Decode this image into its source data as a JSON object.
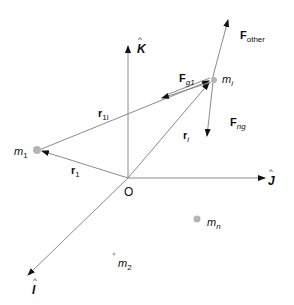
{
  "diagram": {
    "title": "",
    "origin_label": "O",
    "axes": {
      "k": {
        "label": "K"
      },
      "j": {
        "label": "J"
      },
      "i": {
        "label": "I"
      }
    },
    "masses": {
      "m1": {
        "base": "m",
        "sub": "1"
      },
      "mi": {
        "base": "m",
        "sub": "i"
      },
      "mn": {
        "base": "m",
        "sub": "n"
      },
      "m2": {
        "base": "m",
        "sub": "2"
      }
    },
    "vectors": {
      "r1": {
        "base": "r",
        "sub": "1"
      },
      "r1i": {
        "base": "r",
        "sub": "1i"
      },
      "ri": {
        "base": "r",
        "sub": "i"
      }
    },
    "forces": {
      "f_other": {
        "base": "F",
        "sub": "other"
      },
      "f_g1": {
        "base": "F",
        "sub": "g1"
      },
      "f_ng": {
        "base": "F",
        "sub": "ng"
      }
    },
    "colors": {
      "line": "#8a8a8a",
      "arrow": "#111111",
      "mass_dot": "#b5b5b5",
      "text": "#111111"
    }
  }
}
